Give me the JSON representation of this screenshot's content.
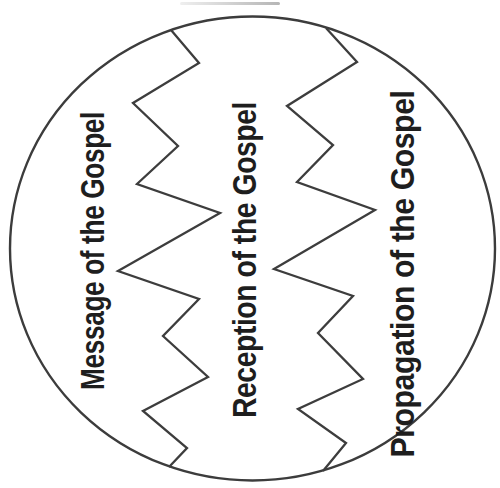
{
  "diagram": {
    "type": "circle-with-zigzag-divisions",
    "title": "",
    "sections": [
      {
        "id": "message",
        "label": "Message of the Gospel"
      },
      {
        "id": "reception",
        "label": "Reception of the Gospel"
      },
      {
        "id": "propagation",
        "label": "Propagation of the Gospel"
      }
    ],
    "dividers": [
      {
        "name": "left-zigzag",
        "style": "jagged vertical line"
      },
      {
        "name": "right-zigzag",
        "style": "jagged vertical line"
      }
    ],
    "colors": {
      "background": "#ffffff",
      "line": "#3c3c3c",
      "text": "#1e1e1e"
    },
    "text_orientation": "rotated 90deg counterclockwise, reads bottom to top"
  }
}
